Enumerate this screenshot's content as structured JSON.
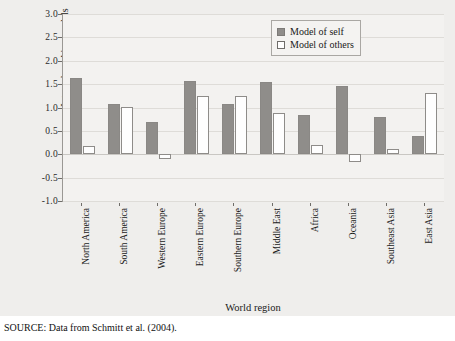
{
  "chart_data": {
    "type": "bar",
    "title": "",
    "xlabel": "World region",
    "ylabel": "Internal working models",
    "ylim": [
      -1.0,
      3.0
    ],
    "yticks": [
      3.0,
      2.5,
      2.0,
      1.5,
      1.0,
      0.5,
      0.0,
      -0.5,
      -1.0
    ],
    "ytick_labels": [
      "3.0",
      "2.5",
      "2.0",
      "1.5",
      "1.0",
      "0.5",
      "0.0",
      "-0.5",
      "-1.0"
    ],
    "grid": true,
    "legend_position": "top-right",
    "categories": [
      "North America",
      "South America",
      "Western Europe",
      "Eastern Europe",
      "Southern Europe",
      "Middle East",
      "Africa",
      "Oceania",
      "Southeast Asia",
      "East Asia"
    ],
    "series": [
      {
        "name": "Model of self",
        "color": "#8f8d8a",
        "values": [
          1.63,
          1.08,
          0.68,
          1.57,
          1.07,
          1.55,
          0.84,
          1.45,
          0.8,
          0.38
        ]
      },
      {
        "name": "Model of others",
        "color": "#ffffff",
        "values": [
          0.17,
          1.02,
          -0.1,
          1.25,
          1.25,
          0.89,
          0.2,
          -0.16,
          0.11,
          1.3
        ]
      }
    ]
  },
  "legend": {
    "items": [
      {
        "label": "Model of self"
      },
      {
        "label": "Model of others"
      }
    ]
  },
  "source": {
    "text": "SOURCE: Data from Schmitt et al. (2004)."
  },
  "colors": {
    "figure_background": "#efeeec",
    "plot_background": "#f3f2f0",
    "self_fill": "#8f8d8a",
    "others_fill": "#ffffff",
    "axis": "#9a9894",
    "grid": "#dedcd8"
  }
}
